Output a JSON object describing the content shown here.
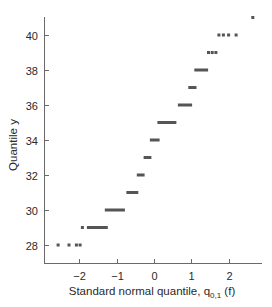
{
  "chart_data": {
    "type": "scatter",
    "title": "",
    "xlabel": "Standard normal quantile, q",
    "xlabel_subscript": "0,1",
    "xlabel_suffix": " (f)",
    "ylabel": "Quantile y",
    "xlim": [
      -2.95,
      2.85
    ],
    "ylim": [
      27.0,
      41.3
    ],
    "xticks": [
      -2,
      -1,
      0,
      1,
      2
    ],
    "xtick_labels": [
      "−2",
      "−1",
      "0",
      "1",
      "2"
    ],
    "yticks": [
      28,
      30,
      32,
      34,
      36,
      38,
      40
    ],
    "ytick_labels": [
      "28",
      "30",
      "32",
      "34",
      "36",
      "38",
      "40"
    ],
    "grid": false,
    "legend": null,
    "marker_color": "#555555",
    "points": [
      {
        "y": 28,
        "x": [
          -2.57,
          -2.28,
          -2.08,
          -1.98
        ]
      },
      {
        "y": 29,
        "x": [
          -1.92
        ]
      },
      {
        "y": 41,
        "x": [
          2.65
        ]
      },
      {
        "y": 39,
        "x": [
          1.46,
          1.56,
          1.66
        ]
      },
      {
        "y": 40,
        "x": [
          1.74,
          1.86,
          2.0,
          2.2
        ]
      }
    ],
    "runs": [
      {
        "y": 29,
        "x_start": -1.8,
        "x_end": -1.24
      },
      {
        "y": 30,
        "x_start": -1.32,
        "x_end": -0.78
      },
      {
        "y": 31,
        "x_start": -0.74,
        "x_end": -0.42
      },
      {
        "y": 32,
        "x_start": -0.46,
        "x_end": -0.25
      },
      {
        "y": 33,
        "x_start": -0.28,
        "x_end": -0.07
      },
      {
        "y": 34,
        "x_start": -0.11,
        "x_end": 0.15
      },
      {
        "y": 35,
        "x_start": 0.09,
        "x_end": 0.6
      },
      {
        "y": 36,
        "x_start": 0.64,
        "x_end": 1.02
      },
      {
        "y": 37,
        "x_start": 0.92,
        "x_end": 1.14
      },
      {
        "y": 38,
        "x_start": 1.08,
        "x_end": 1.45
      }
    ]
  }
}
